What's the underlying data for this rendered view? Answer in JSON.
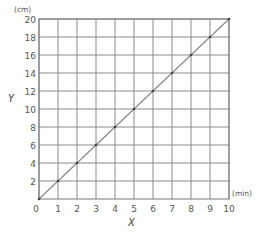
{
  "chart_data": {
    "type": "line",
    "title": "",
    "xlabel": "X",
    "ylabel": "Y",
    "x_unit": "(min)",
    "y_unit": "(cm)",
    "xlim": [
      0,
      10
    ],
    "ylim": [
      0,
      20
    ],
    "grid": true,
    "x_ticks": [
      "0",
      "1",
      "2",
      "3",
      "4",
      "5",
      "6",
      "7",
      "8",
      "9",
      "10"
    ],
    "y_ticks": [
      "2",
      "4",
      "6",
      "8",
      "10",
      "12",
      "14",
      "16",
      "18",
      "20"
    ],
    "origin_label": "0",
    "series": [
      {
        "name": "Y vs X",
        "x": [
          0,
          1,
          2,
          3,
          4,
          5,
          6,
          7,
          8,
          9,
          10
        ],
        "values": [
          0,
          2,
          4,
          6,
          8,
          10,
          12,
          14,
          16,
          18,
          20
        ]
      }
    ],
    "legend": null
  },
  "colors": {
    "grid": "#8a8a8a",
    "line": "#888888",
    "text": "#555555"
  }
}
